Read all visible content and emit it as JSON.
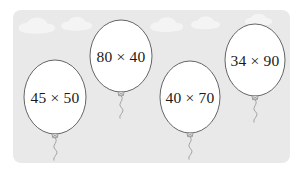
{
  "scene": {
    "title": "Balloons with multiplication expressions",
    "canvas": {
      "width": 302,
      "height": 176
    },
    "background_color": "#ffffff",
    "panel": {
      "fill_color": "#e9e9e9",
      "x": 13,
      "y": 10,
      "width": 277,
      "height": 153,
      "corner_radius": 8
    },
    "cloud_color": "#f6f6f6",
    "clouds": [
      {
        "cx": 36,
        "cy": 26,
        "scale": 1.0
      },
      {
        "cx": 76,
        "cy": 24,
        "scale": 0.85
      },
      {
        "cx": 166,
        "cy": 25,
        "scale": 0.9
      },
      {
        "cx": 205,
        "cy": 23,
        "scale": 0.8
      },
      {
        "cx": 258,
        "cy": 20,
        "scale": 0.75
      }
    ],
    "balloon_style": {
      "fill_color": "#ffffff",
      "outline_color": "#555555",
      "outline_width": 0.9,
      "knot_color": "#8a8a8a",
      "string_color": "#9a9a9a"
    }
  },
  "balloons": [
    {
      "id": "balloon-1",
      "label": "45 × 50",
      "left_factor": 45,
      "right_factor": 50,
      "operator": "×",
      "cx": 55,
      "cy": 97,
      "rx": 31,
      "ry": 37
    },
    {
      "id": "balloon-2",
      "label": "80 × 40",
      "left_factor": 80,
      "right_factor": 40,
      "operator": "×",
      "cx": 121,
      "cy": 56,
      "rx": 31,
      "ry": 36
    },
    {
      "id": "balloon-3",
      "label": "40 × 70",
      "left_factor": 40,
      "right_factor": 70,
      "operator": "×",
      "cx": 190,
      "cy": 97,
      "rx": 30,
      "ry": 36
    },
    {
      "id": "balloon-4",
      "label": "34 × 90",
      "left_factor": 34,
      "right_factor": 90,
      "operator": "×",
      "cx": 255,
      "cy": 60,
      "rx": 30,
      "ry": 36
    }
  ]
}
